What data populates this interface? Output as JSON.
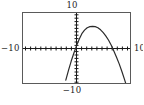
{
  "figure": {
    "kind": "graphing-calculator-viewing-window",
    "background_color": "#ffffff",
    "frame_color": "#5a5a5a",
    "axis_color": "#1a1a1a",
    "curve_color": "#2b2b2b"
  },
  "labels": {
    "top": "10",
    "bottom": "−10",
    "left": "−10",
    "right": "10"
  },
  "chart_data": {
    "type": "line",
    "title": "",
    "subtitle": "",
    "xlabel": "",
    "ylabel": "",
    "xlim": [
      -10,
      10
    ],
    "ylim": [
      -10,
      10
    ],
    "grid": false,
    "legend": false,
    "legend_position": "none",
    "x_tick_labels": [
      "−10",
      "10"
    ],
    "y_tick_labels": [
      "10",
      "−10"
    ],
    "x_tick_spacing": 1,
    "y_tick_spacing": 1,
    "annotations": [],
    "series": [
      {
        "name": "parabola",
        "description": "downward-opening parabola, vertex in the first quadrant",
        "vertex": [
          4.3,
          6.2
        ],
        "x_intercepts": [
          -0.6,
          9.2
        ],
        "opens": "down",
        "x": [
          -2.0,
          -1.5,
          -1.0,
          -0.5,
          0.0,
          0.5,
          1.0,
          1.5,
          2.0,
          2.5,
          3.0,
          3.5,
          4.0,
          4.5,
          5.0,
          5.5,
          6.0,
          6.5,
          7.0,
          7.5,
          8.0,
          8.5,
          9.0,
          9.5,
          10.0
        ],
        "y": [
          -9.2,
          -6.4,
          -3.8,
          -1.5,
          0.6,
          2.5,
          4.1,
          5.1,
          5.8,
          6.1,
          6.2,
          6.1,
          5.8,
          5.2,
          4.4,
          3.4,
          2.2,
          0.8,
          -0.9,
          -2.7,
          -4.6,
          -6.8,
          -9.1,
          -11.6,
          -14.3
        ]
      }
    ]
  }
}
